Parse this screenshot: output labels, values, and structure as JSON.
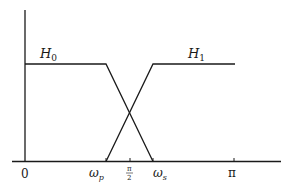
{
  "diagram": {
    "type": "filter-bank-frequency-response",
    "curves": [
      {
        "name": "H0",
        "label_main": "H",
        "label_sub": "0",
        "shape": "lowpass",
        "points": [
          [
            0,
            1
          ],
          [
            0.34,
            1
          ],
          [
            0.49,
            0
          ]
        ]
      },
      {
        "name": "H1",
        "label_main": "H",
        "label_sub": "1",
        "shape": "highpass",
        "points": [
          [
            0.34,
            0
          ],
          [
            0.49,
            1
          ],
          [
            1.0,
            1
          ]
        ]
      }
    ],
    "x_ticks": [
      {
        "id": "zero",
        "label": "0"
      },
      {
        "id": "omega_p",
        "label_main": "ω",
        "label_sub": "p"
      },
      {
        "id": "half_pi",
        "label_num": "π",
        "label_den": "2"
      },
      {
        "id": "omega_s",
        "label_main": "ω",
        "label_sub": "s"
      },
      {
        "id": "pi",
        "label": "π"
      }
    ],
    "colors": {
      "line": "#1a1a1a",
      "background": "#ffffff"
    }
  }
}
